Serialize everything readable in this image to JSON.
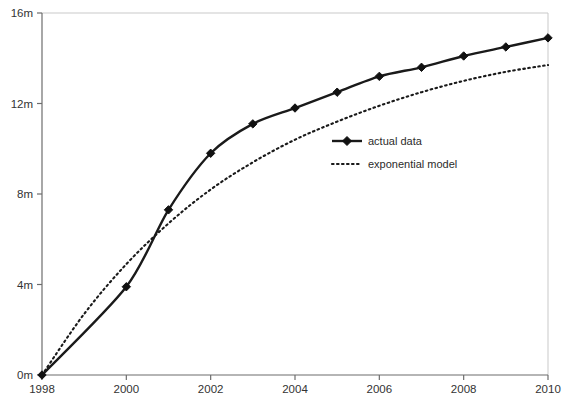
{
  "chart_data": {
    "type": "line",
    "title": "",
    "subtitle": "",
    "xlabel": "",
    "ylabel": "",
    "xlim": [
      1998,
      2010
    ],
    "ylim": [
      0,
      16
    ],
    "grid": false,
    "legend_position": "inside-right",
    "x": [
      1998,
      1999,
      2000,
      2001,
      2002,
      2003,
      2004,
      2005,
      2006,
      2007,
      2008,
      2009,
      2010
    ],
    "x_ticks": [
      1998,
      2000,
      2002,
      2004,
      2006,
      2008,
      2010
    ],
    "x_tick_labels": [
      "1998",
      "2000",
      "2002",
      "2004",
      "2006",
      "2008",
      "2010"
    ],
    "y_ticks": [
      0,
      4,
      8,
      12,
      16
    ],
    "y_tick_labels": [
      "0m",
      "4m",
      "8m",
      "12m",
      "16m"
    ],
    "series": [
      {
        "name": "actual data",
        "style": "solid-with-markers",
        "color": "#1a1a1a",
        "x": [
          1998,
          2000,
          2001,
          2002,
          2003,
          2004,
          2005,
          2006,
          2007,
          2008,
          2009,
          2010
        ],
        "values": [
          0.0,
          3.9,
          7.3,
          9.8,
          11.1,
          11.8,
          12.5,
          13.2,
          13.6,
          14.1,
          14.5,
          14.9
        ]
      },
      {
        "name": "exponential model",
        "style": "dotted",
        "color": "#1a1a1a",
        "x": [
          1998,
          1999,
          2000,
          2001,
          2002,
          2003,
          2004,
          2005,
          2006,
          2007,
          2008,
          2009,
          2010
        ],
        "values": [
          0.0,
          2.7,
          4.9,
          6.7,
          8.2,
          9.4,
          10.4,
          11.2,
          11.9,
          12.5,
          13.0,
          13.4,
          13.7
        ]
      }
    ]
  },
  "legend": {
    "items": [
      {
        "label": "actual data",
        "swatch": "solid-line-marker"
      },
      {
        "label": "exponential model",
        "swatch": "dotted-line"
      }
    ]
  },
  "axes": {
    "y_axis_name": "value-axis",
    "x_axis_name": "year-axis"
  }
}
